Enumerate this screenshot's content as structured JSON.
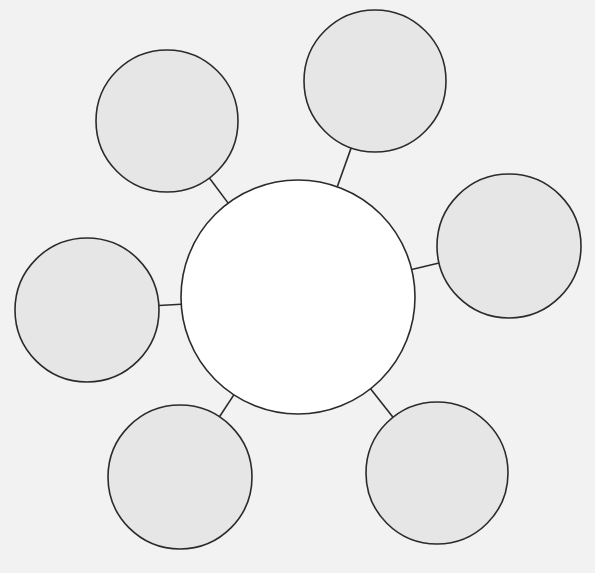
{
  "canvas": {
    "width": 595,
    "height": 573,
    "background": "#f2f2f2"
  },
  "style": {
    "stroke": "#2b2b2b",
    "stroke_width": 1.6,
    "center_fill": "#ffffff",
    "satellite_fill": "#e6e6e6"
  },
  "center": {
    "cx": 298,
    "cy": 297,
    "r": 117
  },
  "satellites": [
    {
      "id": "top-left",
      "cx": 167,
      "cy": 121,
      "r": 71
    },
    {
      "id": "top-right",
      "cx": 375,
      "cy": 81,
      "r": 71
    },
    {
      "id": "right",
      "cx": 509,
      "cy": 246,
      "r": 72
    },
    {
      "id": "left",
      "cx": 87,
      "cy": 310,
      "r": 72
    },
    {
      "id": "bottom-left",
      "cx": 180,
      "cy": 477,
      "r": 72
    },
    {
      "id": "bottom-right",
      "cx": 437,
      "cy": 473,
      "r": 71
    }
  ],
  "labels": {
    "center": "",
    "satellites": [
      "",
      "",
      "",
      "",
      "",
      ""
    ]
  }
}
